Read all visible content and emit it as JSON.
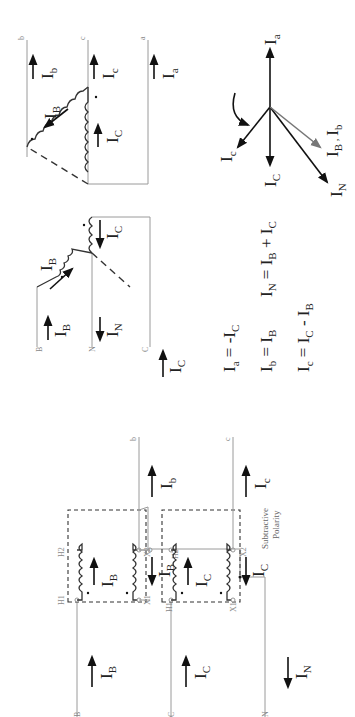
{
  "diagram": {
    "orientation": "rotated -90deg (text reads bottom-to-top)",
    "transformer_bank": {
      "primary_lines": [
        "B",
        "C",
        "N"
      ],
      "secondary_lines": [
        "b",
        "c"
      ],
      "transformers": [
        {
          "id": "T1",
          "terminals": {
            "h1": "H1",
            "h2": "H2",
            "x1": "X1",
            "x2": "X2"
          },
          "primary_current": {
            "symbol": "I",
            "sub": "B"
          },
          "secondary_current": {
            "symbol": "I",
            "sub": "B"
          }
        },
        {
          "id": "T2",
          "terminals": {
            "h1": "H1",
            "h2": "H2",
            "x1": "X1",
            "x2": "X2"
          },
          "primary_current": {
            "symbol": "I",
            "sub": "C"
          },
          "secondary_current": {
            "symbol": "I",
            "sub": "C"
          }
        }
      ],
      "line_currents": {
        "primary_B": {
          "symbol": "I",
          "sub": "B"
        },
        "primary_C": {
          "symbol": "I",
          "sub": "C"
        },
        "neutral": {
          "symbol": "I",
          "sub": "N"
        },
        "secondary_b": {
          "symbol": "I",
          "sub": "b"
        },
        "secondary_c": {
          "symbol": "I",
          "sub": "c"
        }
      },
      "polarity_note_line1": "Subtractive",
      "polarity_note_line2": "Polarity"
    },
    "wye_section": {
      "lines": [
        "B",
        "N",
        "C"
      ],
      "currents": {
        "line_B": {
          "symbol": "I",
          "sub": "B"
        },
        "winding_B": {
          "symbol": "I",
          "sub": "B"
        },
        "winding_C": {
          "symbol": "I",
          "sub": "C"
        },
        "neutral": {
          "symbol": "I",
          "sub": "N"
        },
        "line_C": {
          "symbol": "I",
          "sub": "C"
        }
      }
    },
    "delta_section": {
      "lines": [
        "b",
        "c",
        "a"
      ],
      "currents": {
        "winding_B": {
          "symbol": "I",
          "sub": "B"
        },
        "winding_C": {
          "symbol": "I",
          "sub": "C"
        },
        "line_b": {
          "symbol": "I",
          "sub": "b"
        },
        "line_c": {
          "symbol": "I",
          "sub": "c"
        },
        "line_a": {
          "symbol": "I",
          "sub": "a"
        }
      }
    },
    "equations": {
      "ia": {
        "lhs": "I",
        "lhs_sub": "a",
        "eq": " = -I",
        "rhs_sub": "C"
      },
      "ib": {
        "lhs": "I",
        "lhs_sub": "b",
        "eq": " = I",
        "rhs_sub": "B"
      },
      "ic": {
        "lhs": "I",
        "lhs_sub": "c",
        "eq": " = I",
        "rhs_sub": "C",
        "rest": " - I",
        "rest_sub": "B"
      },
      "in": {
        "lhs": "I",
        "lhs_sub": "N",
        "eq": " = I",
        "rhs_sub": "B",
        "rest": " + I",
        "rest_sub": "C"
      }
    },
    "phasor_diagram": {
      "rotation_hint": "counter-clockwise arrow",
      "phasors": [
        {
          "name": "Ia",
          "symbol": "I",
          "sub": "a",
          "color": "#222222"
        },
        {
          "name": "Ic",
          "symbol": "I",
          "sub": "c",
          "color": "#222222"
        },
        {
          "name": "IC",
          "symbol": "I",
          "sub": "C",
          "color": "#222222"
        },
        {
          "name": "IN",
          "symbol": "I",
          "sub": "N",
          "color": "#222222"
        },
        {
          "name": "IB_Ib",
          "symbol": "I",
          "sub": "B",
          "sep": " , ",
          "symbol2": "I",
          "sub2": "b",
          "color": "#777777"
        }
      ]
    }
  }
}
